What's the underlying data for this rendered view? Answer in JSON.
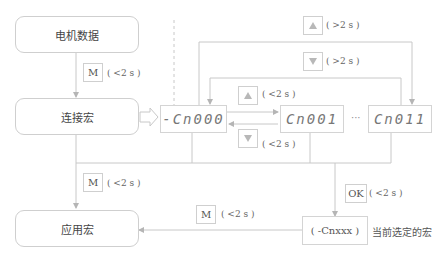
{
  "boxes": {
    "motor_data": "电机数据",
    "connection_macro": "连接宏",
    "application_macro": "应用宏",
    "selected_macro": "( -Cnxxx )"
  },
  "displays": {
    "d0": "-Cn000",
    "d1": "Cn001",
    "d2": "Cn011",
    "ellipsis": "···"
  },
  "keys": {
    "m_key": "M",
    "ok_key": "OK",
    "up_icon": "up-arrow-key",
    "down_icon": "down-arrow-key"
  },
  "labels": {
    "m_top": "( <2 s )",
    "up_long": "( >2 s )",
    "down_long": "( >2 s )",
    "up_short": "( <2 s )",
    "down_short": "( <2 s )",
    "m_left": "( <2 s )",
    "ok": "( <2 s )",
    "m_bottom": "( <2 s )"
  },
  "annotations": {
    "selected_note": "当前选定的宏"
  },
  "colors": {
    "line": "#c8c8c8",
    "border": "#cfcfcf",
    "text": "#555555"
  }
}
